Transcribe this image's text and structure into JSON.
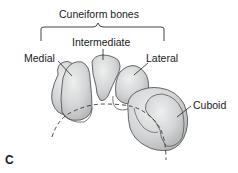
{
  "figure": {
    "panel_label": "C",
    "group_label": "Cuneiform bones",
    "labels": {
      "medial": "Medial",
      "intermediate": "Intermediate",
      "lateral": "Lateral",
      "cuboid": "Cuboid"
    },
    "colors": {
      "bone_fill": "#d4d6d7",
      "bone_highlight": "#e9eaea",
      "bone_shadow": "#b8babb",
      "outline": "#555859",
      "text": "#1a1a1a"
    }
  }
}
